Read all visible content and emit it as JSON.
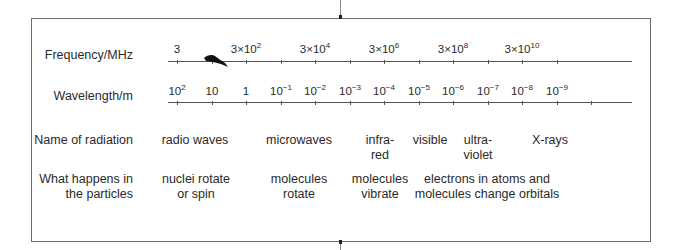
{
  "diagram": {
    "rows": {
      "frequency": {
        "label": "Frequency/MHz",
        "ticks": [
          {
            "x": 177,
            "label": "3"
          },
          {
            "x": 212,
            "label": ""
          },
          {
            "x": 246,
            "label": "3×10",
            "exp": "2"
          },
          {
            "x": 281,
            "label": ""
          },
          {
            "x": 315,
            "label": "3×10",
            "exp": "4"
          },
          {
            "x": 350,
            "label": ""
          },
          {
            "x": 384,
            "label": "3×10",
            "exp": "6"
          },
          {
            "x": 419,
            "label": ""
          },
          {
            "x": 453,
            "label": "3×10",
            "exp": "8"
          },
          {
            "x": 488,
            "label": ""
          },
          {
            "x": 522,
            "label": "3×10",
            "exp": "10"
          },
          {
            "x": 557,
            "label": ""
          }
        ]
      },
      "wavelength": {
        "label": "Wavelength/m",
        "ticks": [
          {
            "x": 177,
            "label": "10",
            "exp": "2"
          },
          {
            "x": 212,
            "label": "10"
          },
          {
            "x": 246,
            "label": "1"
          },
          {
            "x": 281,
            "label": "10",
            "exp": "−1"
          },
          {
            "x": 315,
            "label": "10",
            "exp": "−2"
          },
          {
            "x": 350,
            "label": "10",
            "exp": "−3"
          },
          {
            "x": 384,
            "label": "10",
            "exp": "−4"
          },
          {
            "x": 419,
            "label": "10",
            "exp": "−5"
          },
          {
            "x": 453,
            "label": "10",
            "exp": "−6"
          },
          {
            "x": 488,
            "label": "10",
            "exp": "−7"
          },
          {
            "x": 522,
            "label": "10",
            "exp": "−8"
          },
          {
            "x": 557,
            "label": "10",
            "exp": "−9"
          },
          {
            "x": 591,
            "label": ""
          }
        ]
      },
      "radiation": {
        "label": "Name of radiation",
        "items": [
          {
            "x": 195,
            "text": "radio waves"
          },
          {
            "x": 299,
            "text": "microwaves"
          },
          {
            "x": 380,
            "text": "infra-\nred"
          },
          {
            "x": 430,
            "text": "visible"
          },
          {
            "x": 478,
            "text": "ultra-\nviolet"
          },
          {
            "x": 550,
            "text": "X-rays"
          }
        ]
      },
      "particles": {
        "label": "What happens in\nthe particles",
        "items": [
          {
            "x": 196,
            "text": "nuclei rotate\nor spin"
          },
          {
            "x": 299,
            "text": "molecules\nrotate"
          },
          {
            "x": 380,
            "text": "molecules\nvibrate"
          },
          {
            "x": 487,
            "text": "electrons in atoms and\nmolecules change orbitals"
          }
        ]
      }
    }
  }
}
